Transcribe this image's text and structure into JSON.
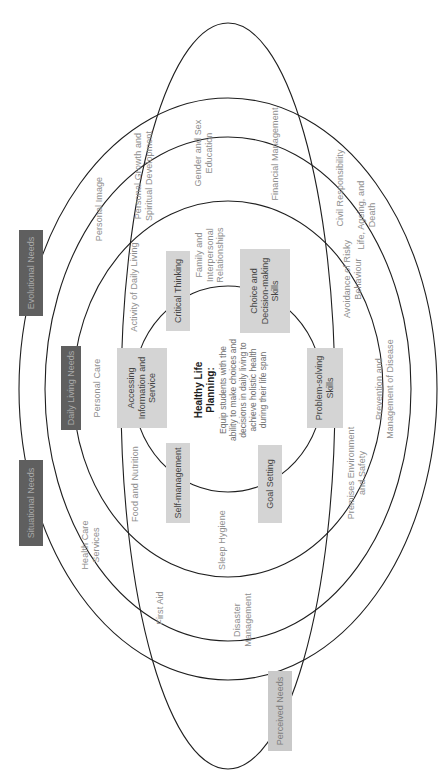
{
  "diagram": {
    "colors": {
      "background": "#ffffff",
      "ring_stroke": "#1f1f1f",
      "skill_box_fill": "#d4d4d4",
      "skill_box_text": "#454545",
      "dark_box_fill": "#5f5f5f",
      "dark_box_text": "#a9a9a9",
      "light_box_fill": "#c9c9c9",
      "light_box_text": "#7d7d7d",
      "item_text": "#8e8e8e"
    },
    "center": {
      "title": "Healthy Life\nPlanning:",
      "body": "Equip students with the ability to make choices and decisions in daily living to achieve holistic health during their life span"
    },
    "ellipses": [
      {
        "id": "inner-core-ellipse",
        "cx": 390,
        "cy": 228,
        "rx": 103,
        "ry": 95
      },
      {
        "id": "daily-living-ellipse",
        "cx": 390,
        "cy": 228,
        "rx": 188,
        "ry": 155
      },
      {
        "id": "evolutional-ellipse",
        "cx": 390,
        "cy": 228,
        "rx": 252,
        "ry": 183
      },
      {
        "id": "situational-ellipse",
        "cx": 390,
        "cy": 228,
        "rx": 291,
        "ry": 209
      },
      {
        "id": "perceived-ellipse",
        "cx": 383,
        "cy": 228,
        "rx": 373,
        "ry": 107
      }
    ],
    "ring_labels": [
      {
        "id": "situational-needs-label",
        "label": "Situational Needs",
        "x": 276,
        "y": 31,
        "w": 86,
        "h": 24,
        "style": "dark"
      },
      {
        "id": "evolutional-needs-label",
        "label": "Evolutional Needs",
        "x": 506,
        "y": 31,
        "w": 86,
        "h": 24,
        "style": "dark"
      },
      {
        "id": "daily-living-needs-label",
        "label": "Daily Living Needs",
        "x": 391,
        "y": 71,
        "w": 84,
        "h": 20,
        "style": "dark"
      },
      {
        "id": "perceived-needs-label",
        "label": "Perceived Needs",
        "x": 68,
        "y": 280,
        "w": 80,
        "h": 24,
        "style": "light"
      }
    ],
    "skills": [
      {
        "id": "accessing-information-and-service",
        "label": "Accessing\nInformation and\nService",
        "x": 391,
        "y": 142,
        "w": 80,
        "h": 50
      },
      {
        "id": "critical-thinking",
        "label": "Critical Thinking",
        "x": 488,
        "y": 178,
        "w": 80,
        "h": 24
      },
      {
        "id": "choice-decision-making",
        "label": "Choice and\nDecision-making\nSkills",
        "x": 488,
        "y": 265,
        "w": 84,
        "h": 50
      },
      {
        "id": "problem-solving-skills",
        "label": "Problem-solving\nSkills",
        "x": 391,
        "y": 325,
        "w": 80,
        "h": 36
      },
      {
        "id": "goal-setting",
        "label": "Goal Setting",
        "x": 295,
        "y": 270,
        "w": 78,
        "h": 24
      },
      {
        "id": "self-management",
        "label": "Self-management",
        "x": 296,
        "y": 178,
        "w": 80,
        "h": 24
      }
    ],
    "items": [
      {
        "id": "personal-care",
        "label": "Personal Care",
        "x": 391,
        "y": 97
      },
      {
        "id": "food-and-nutrition",
        "label": "Food and Nutrition",
        "x": 295,
        "y": 135
      },
      {
        "id": "sleep-hygiene",
        "label": "Sleep Hygiene",
        "x": 239,
        "y": 222
      },
      {
        "id": "premises-environment",
        "label": "Premises Environment\nand Safety",
        "x": 306,
        "y": 357
      },
      {
        "id": "activity-of-daily-living",
        "label": "Activity of Daily Living",
        "x": 492,
        "y": 134
      },
      {
        "id": "family-interpersonal",
        "label": "Family and\nInterpersonal\nRelationships",
        "x": 524,
        "y": 210
      },
      {
        "id": "prevention-management-disease",
        "label": "Prevention and\nManagement of Disease",
        "x": 390,
        "y": 385
      },
      {
        "id": "personal-image",
        "label": "Personal Image",
        "x": 570,
        "y": 99
      },
      {
        "id": "personal-growth-spiritual",
        "label": "Personal Growth and\nSpiritual Development",
        "x": 603,
        "y": 144
      },
      {
        "id": "gender-and-sex-education",
        "label": "Gender and Sex\nEducation",
        "x": 626,
        "y": 204
      },
      {
        "id": "financial-management",
        "label": "Financial Management",
        "x": 625,
        "y": 275
      },
      {
        "id": "health-care-services",
        "label": "Health Care\nServices",
        "x": 234,
        "y": 91
      },
      {
        "id": "first-aid",
        "label": "First Aid",
        "x": 171,
        "y": 160
      },
      {
        "id": "disaster-management",
        "label": "Disaster\nManagement",
        "x": 159,
        "y": 243
      },
      {
        "id": "civil-responsibility",
        "label": "Civil Responsibility",
        "x": 591,
        "y": 340
      },
      {
        "id": "life-ageing-and-death",
        "label": "Life, Ageing, and\nDeath",
        "x": 564,
        "y": 367
      },
      {
        "id": "avoidance-risky-behaviour",
        "label": "Avoidance of Risky\nBehaviour",
        "x": 500,
        "y": 353
      }
    ]
  }
}
